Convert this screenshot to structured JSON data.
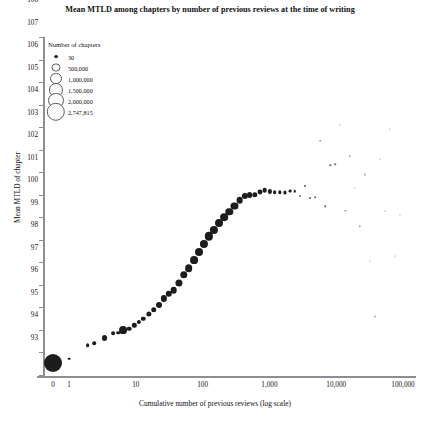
{
  "chart_data": {
    "type": "scatter",
    "title": "Mean MTLD among chapters by number of previous reviews at the time of writing",
    "xlabel": "Cumulative number of previous reviews (log scale)",
    "ylabel": "Mean MTLD of chapter",
    "grid": false,
    "xscale": "log",
    "xlim": [
      0,
      100000
    ],
    "ylim": [
      93,
      108
    ],
    "xticks": [
      "0",
      "1",
      "10",
      "100",
      "1,000",
      "10,000",
      "100,000"
    ],
    "xtick_values": [
      0,
      1,
      10,
      100,
      1000,
      10000,
      100000
    ],
    "yticks": [
      93,
      94,
      95,
      96,
      97,
      98,
      99,
      100,
      101,
      102,
      103,
      104,
      105,
      106,
      107,
      108
    ],
    "legend": {
      "title": "Number of chapters",
      "position": "top-left",
      "entries": [
        {
          "label": "30",
          "size": 30
        },
        {
          "label": "500,000",
          "size": 500000
        },
        {
          "label": "1,000,000",
          "size": 1000000
        },
        {
          "label": "1,500,000",
          "size": 1500000
        },
        {
          "label": "2,000,000",
          "size": 2000000
        },
        {
          "label": "2,747,815",
          "size": 2747815
        }
      ]
    },
    "points": [
      {
        "x": 0,
        "y": 93.55,
        "size": 2747815
      },
      {
        "x": 1,
        "y": 93.72,
        "size": 60000
      },
      {
        "x": 1.9,
        "y": 94.32,
        "size": 120000
      },
      {
        "x": 2.4,
        "y": 94.42,
        "size": 110000
      },
      {
        "x": 3.4,
        "y": 94.62,
        "size": 300000
      },
      {
        "x": 4.6,
        "y": 94.85,
        "size": 120000
      },
      {
        "x": 5.5,
        "y": 94.88,
        "size": 110000
      },
      {
        "x": 6.5,
        "y": 94.98,
        "size": 520000
      },
      {
        "x": 8.0,
        "y": 95.05,
        "size": 180000
      },
      {
        "x": 9.5,
        "y": 95.2,
        "size": 160000
      },
      {
        "x": 11.0,
        "y": 95.35,
        "size": 150000
      },
      {
        "x": 13.0,
        "y": 95.5,
        "size": 170000
      },
      {
        "x": 15.5,
        "y": 95.7,
        "size": 230000
      },
      {
        "x": 18.5,
        "y": 95.9,
        "size": 260000
      },
      {
        "x": 22.0,
        "y": 96.1,
        "size": 300000
      },
      {
        "x": 26.0,
        "y": 96.4,
        "size": 330000
      },
      {
        "x": 31.0,
        "y": 96.6,
        "size": 350000
      },
      {
        "x": 37.0,
        "y": 96.78,
        "size": 380000
      },
      {
        "x": 44.0,
        "y": 97.1,
        "size": 430000
      },
      {
        "x": 52.0,
        "y": 97.45,
        "size": 470000
      },
      {
        "x": 62.0,
        "y": 97.75,
        "size": 500000
      },
      {
        "x": 74.0,
        "y": 98.1,
        "size": 520000
      },
      {
        "x": 88.0,
        "y": 98.45,
        "size": 540000
      },
      {
        "x": 105.0,
        "y": 98.8,
        "size": 560000
      },
      {
        "x": 125.0,
        "y": 99.15,
        "size": 580000
      },
      {
        "x": 150.0,
        "y": 99.45,
        "size": 560000
      },
      {
        "x": 178.0,
        "y": 99.75,
        "size": 540000
      },
      {
        "x": 212.0,
        "y": 100.0,
        "size": 500000
      },
      {
        "x": 252.0,
        "y": 100.25,
        "size": 470000
      },
      {
        "x": 300.0,
        "y": 100.5,
        "size": 420000
      },
      {
        "x": 357.0,
        "y": 100.75,
        "size": 380000
      },
      {
        "x": 425.0,
        "y": 100.95,
        "size": 330000
      },
      {
        "x": 505.0,
        "y": 101.0,
        "size": 290000
      },
      {
        "x": 600.0,
        "y": 101.0,
        "size": 250000
      },
      {
        "x": 715.0,
        "y": 101.1,
        "size": 210000
      },
      {
        "x": 850.0,
        "y": 101.2,
        "size": 180000
      },
      {
        "x": 1010.0,
        "y": 101.15,
        "size": 150000
      },
      {
        "x": 1200.0,
        "y": 101.1,
        "size": 120000
      },
      {
        "x": 1430.0,
        "y": 101.1,
        "size": 100000
      },
      {
        "x": 1700.0,
        "y": 101.1,
        "size": 85000
      },
      {
        "x": 2020.0,
        "y": 101.15,
        "size": 70000
      },
      {
        "x": 2400.0,
        "y": 101.15,
        "size": 55000
      },
      {
        "x": 2860.0,
        "y": 100.95,
        "size": 40000
      },
      {
        "x": 3400.0,
        "y": 101.4,
        "size": 30000
      },
      {
        "x": 4040.0,
        "y": 100.85,
        "size": 28000
      },
      {
        "x": 4800.0,
        "y": 100.9,
        "size": 26000
      },
      {
        "x": 5700.0,
        "y": 103.4,
        "size": 24000
      },
      {
        "x": 6800.0,
        "y": 100.5,
        "size": 22000
      },
      {
        "x": 8100.0,
        "y": 102.3,
        "size": 20000
      },
      {
        "x": 9600.0,
        "y": 102.35,
        "size": 19000
      },
      {
        "x": 11400.0,
        "y": 104.1,
        "size": 18000
      },
      {
        "x": 13600.0,
        "y": 100.3,
        "size": 17000
      },
      {
        "x": 16100.0,
        "y": 102.7,
        "size": 16000
      },
      {
        "x": 19200.0,
        "y": 101.3,
        "size": 15000
      },
      {
        "x": 22800.0,
        "y": 99.6,
        "size": 14000
      },
      {
        "x": 27100.0,
        "y": 101.9,
        "size": 13000
      },
      {
        "x": 32200.0,
        "y": 98.05,
        "size": 12000
      },
      {
        "x": 38300.0,
        "y": 95.6,
        "size": 11000
      },
      {
        "x": 45500.0,
        "y": 102.6,
        "size": 10000
      },
      {
        "x": 54100.0,
        "y": 100.3,
        "size": 9000
      },
      {
        "x": 64300.0,
        "y": 103.9,
        "size": 8000
      },
      {
        "x": 76400.0,
        "y": 98.3,
        "size": 7000
      },
      {
        "x": 90800.0,
        "y": 100.1,
        "size": 6000
      }
    ]
  }
}
